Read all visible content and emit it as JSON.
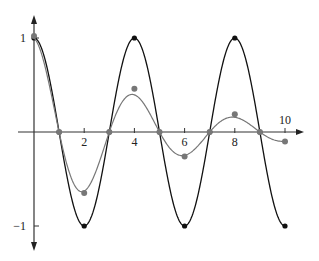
{
  "chart_data": {
    "type": "line",
    "title": "",
    "xlabel": "",
    "ylabel": "",
    "xlim": [
      0,
      10
    ],
    "ylim": [
      -1,
      1
    ],
    "grid": false,
    "x_tick_labels": [
      "2",
      "4",
      "6",
      "8",
      "10"
    ],
    "x_ticks": [
      2,
      4,
      6,
      8,
      10
    ],
    "y_tick_labels": [
      "1",
      "−1"
    ],
    "y_ticks": [
      1,
      -1
    ],
    "series": [
      {
        "name": "cosine",
        "color": "#111111",
        "marker_points": {
          "x": [
            0,
            1,
            2,
            3,
            4,
            5,
            6,
            7,
            8,
            9,
            10
          ],
          "y": [
            1,
            0,
            -1,
            0,
            1,
            0,
            -1,
            0,
            1,
            0,
            -1
          ]
        }
      },
      {
        "name": "damped cosine",
        "color": "#777777",
        "marker_points": {
          "x": [
            0,
            1,
            2,
            3,
            4,
            5,
            6,
            7,
            8,
            9,
            10
          ],
          "y": [
            1.02,
            0,
            -0.65,
            0,
            0.46,
            0,
            -0.26,
            0,
            0.19,
            0,
            -0.1
          ]
        }
      }
    ]
  }
}
